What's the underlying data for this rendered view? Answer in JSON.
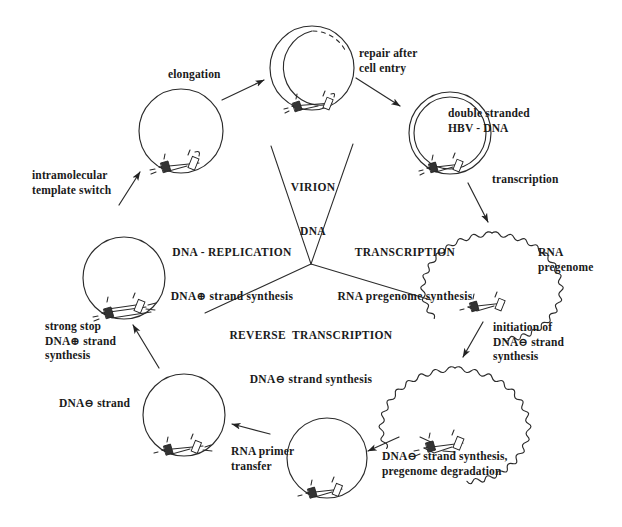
{
  "diagram": {
    "center": {
      "virion": {
        "line1": "VIRION",
        "line2": "DNA"
      },
      "replication": {
        "line1": "DNA - REPLICATION",
        "line2": "DNA⊕ strand synthesis"
      },
      "transcription": {
        "line1": "TRANSCRIPTION",
        "line2": "RNA pregenome synthesis"
      },
      "reverse_transcription": {
        "line1": "REVERSE  TRANSCRIPTION",
        "line2": "DNA⊖ strand synthesis"
      }
    },
    "step_labels": {
      "elongation": "elongation",
      "repair_after_cell_entry": "repair after\ncell entry",
      "double_stranded_hbv_dna": "double stranded\nHBV - DNA",
      "transcription": "transcription",
      "rna_pregenome": "RNA\npregenome",
      "initiation_of_dna_minus": "initiation of\nDNA⊖ strand\nsynthesis",
      "dna_minus_synthesis_degradation": "DNA⊖  strand synthesis,\npregenome degradation",
      "rna_primer_transfer": "RNA primer\ntransfer",
      "dna_minus_strand": "DNA⊖ strand",
      "strong_stop": "strong stop\nDNA⊕ strand\nsynthesis",
      "intramolecular_template_switch": "intramolecular\ntemplate switch"
    },
    "genome_states": [
      {
        "name": "virion-dna-circle",
        "type": "partial-double-dashed",
        "cx": 312,
        "cy": 68,
        "r": 42
      },
      {
        "name": "double-stranded-hbv-dna-circle",
        "type": "double",
        "cx": 450,
        "cy": 133,
        "r": 41
      },
      {
        "name": "rna-pregenome-circle",
        "type": "wavy",
        "cx": 492,
        "cy": 272,
        "r": 39
      },
      {
        "name": "dna-minus-synthesis-circle",
        "type": "wavy",
        "cx": 455,
        "cy": 410,
        "r": 42
      },
      {
        "name": "dna-minus-circle-bottom",
        "type": "single",
        "cx": 327,
        "cy": 458,
        "r": 40
      },
      {
        "name": "rna-primer-transfer-circle",
        "type": "single",
        "cx": 184,
        "cy": 415,
        "r": 41
      },
      {
        "name": "strong-stop-circle",
        "type": "single",
        "cx": 124,
        "cy": 278,
        "r": 41
      },
      {
        "name": "elongation-circle",
        "type": "single",
        "cx": 181,
        "cy": 131,
        "r": 42
      }
    ],
    "colors": {
      "ink": "#1a1a1a",
      "stroke": "#2a2a2a",
      "background": "#ffffff"
    }
  }
}
